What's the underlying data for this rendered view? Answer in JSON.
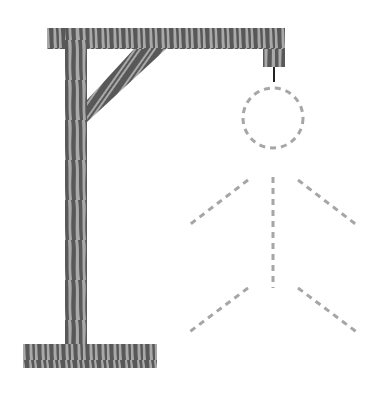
{
  "game": {
    "name": "hangman",
    "gallows": {
      "wood_dark": "#585858",
      "wood_light": "#a9a9a9",
      "rope_color": "#222222"
    },
    "figure": {
      "dash_color": "#a6a6a6",
      "parts": [
        "head",
        "body",
        "left-arm",
        "right-arm",
        "left-leg",
        "right-leg"
      ],
      "state": "outline-dashed"
    }
  }
}
